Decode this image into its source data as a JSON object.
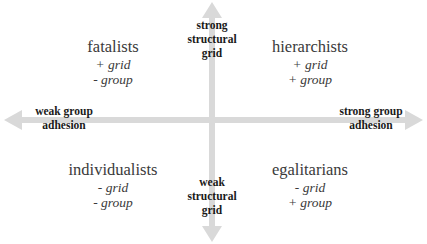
{
  "diagram": {
    "axes": {
      "vertical": {
        "top_label": [
          "strong",
          "structural",
          "grid"
        ],
        "bottom_label": [
          "weak",
          "structural",
          "grid"
        ]
      },
      "horizontal": {
        "left_label": [
          "weak group",
          "adhesion"
        ],
        "right_label": [
          "strong group",
          "adhesion"
        ]
      },
      "arrow_color": "#d9d9d9"
    },
    "quadrants": {
      "top_left": {
        "title": "fatalists",
        "grid": "+ grid",
        "group": "- group"
      },
      "top_right": {
        "title": "hierarchists",
        "grid": "+ grid",
        "group": "+ group"
      },
      "bottom_left": {
        "title": "individualists",
        "grid": "- grid",
        "group": "- group"
      },
      "bottom_right": {
        "title": "egalitarians",
        "grid": "- grid",
        "group": "+ group"
      }
    }
  }
}
